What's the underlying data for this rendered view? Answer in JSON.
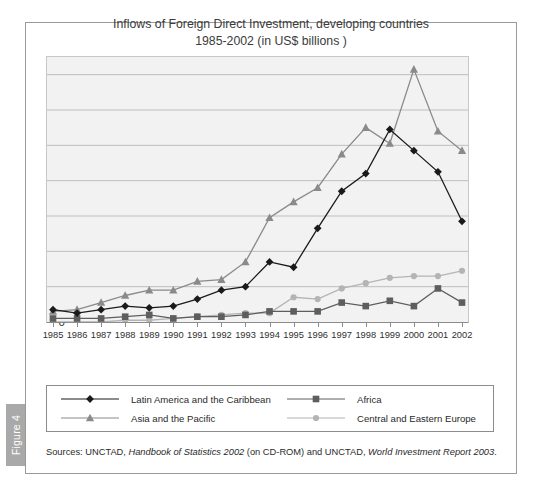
{
  "figure": {
    "tab_label": "Figure 4",
    "title_line1": "Inflows of Foreign Direct Investment, developing countries",
    "title_line2": "1985-2002 (in US$ billions )",
    "sources_prefix": "Sources: UNCTAD, ",
    "sources_italic1": "Handbook of Statistics 2002",
    "sources_mid": " (on CD-ROM) and UNCTAD, ",
    "sources_italic2": "World Investment Report 2003",
    "sources_suffix": "."
  },
  "colors": {
    "latin_america": "#1a1a1a",
    "africa": "#5e5e5e",
    "asia_pacific": "#8a8a8a",
    "central_eastern_europe": "#b4b4b4",
    "plot_background": "#f2f2f2",
    "gridline": "#b8b8b8",
    "frame": "#9a9a9a",
    "tab_background": "#a9a9a9"
  },
  "chart_data": {
    "type": "line",
    "title": "Inflows of Foreign Direct Investment, developing countries 1985-2002 (in US$ billions )",
    "xlabel": "",
    "ylabel": "",
    "ylim": [
      0,
      150
    ],
    "yticks": [
      0,
      20,
      40,
      60,
      80,
      100,
      120,
      140
    ],
    "grid": true,
    "legend_position": "bottom",
    "categories": [
      1985,
      1986,
      1987,
      1988,
      1989,
      1990,
      1991,
      1992,
      1993,
      1994,
      1995,
      1996,
      1997,
      1998,
      1999,
      2000,
      2001,
      2002
    ],
    "series": [
      {
        "name": "Latin America and the Caribbean",
        "marker": "diamond",
        "color": "#1a1a1a",
        "values": [
          7,
          5,
          7,
          9,
          8,
          9,
          13,
          18,
          20,
          34,
          31,
          53,
          74,
          84,
          109,
          97,
          85,
          57
        ]
      },
      {
        "name": "Africa",
        "marker": "square",
        "color": "#5e5e5e",
        "values": [
          2,
          2,
          2,
          3,
          4,
          2,
          3,
          3,
          4,
          6,
          6,
          6,
          11,
          9,
          12,
          9,
          19,
          11
        ]
      },
      {
        "name": "Asia and the Pacific",
        "marker": "triangle",
        "color": "#8a8a8a",
        "values": [
          6,
          7,
          11,
          15,
          18,
          18,
          23,
          24,
          34,
          59,
          68,
          76,
          95,
          110,
          101,
          143,
          108,
          97
        ]
      },
      {
        "name": "Central and Eastern Europe",
        "marker": "circle",
        "color": "#b4b4b4",
        "values": [
          0,
          0,
          0,
          1,
          1,
          2,
          3,
          4,
          5,
          5,
          14,
          13,
          19,
          22,
          25,
          26,
          26,
          29
        ]
      }
    ]
  }
}
